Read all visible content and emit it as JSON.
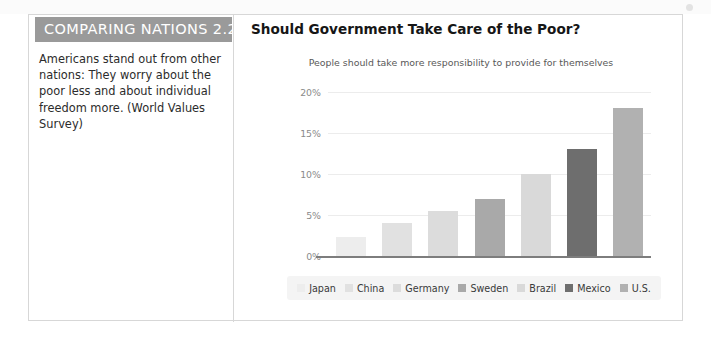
{
  "box": {
    "header_label": "COMPARING NATIONS 2.2",
    "body_text": "Americans stand out from other nations: They worry about the poor less and about individual freedom more. (World Values Survey)"
  },
  "chart_data": {
    "type": "bar",
    "title": "Should Government Take Care of the Poor?",
    "subtitle": "People should take more responsibility to provide for themselves",
    "xlabel": "",
    "ylabel": "",
    "ylim": [
      0,
      20
    ],
    "ytick_labels": [
      "0%",
      "5%",
      "10%",
      "15%",
      "20%"
    ],
    "ytick_values": [
      0,
      5,
      10,
      15,
      20
    ],
    "grid": true,
    "legend_position": "bottom",
    "categories": [
      "Japan",
      "China",
      "Germany",
      "Sweden",
      "Brazil",
      "Mexico",
      "U.S."
    ],
    "values": [
      2.3,
      4.0,
      5.5,
      7.0,
      10.0,
      13.0,
      18.0
    ],
    "colors": [
      "#ededed",
      "#e1e1e1",
      "#dcdcdc",
      "#a9a9a9",
      "#d9d9d9",
      "#6e6e6e",
      "#b1b1b1"
    ]
  },
  "palette": {
    "header_band": "#9a9a9a",
    "border": "#d7d7d7",
    "axis": "#7d7d7d",
    "gridline": "#ececec",
    "legend_bg": "#f4f4f4",
    "title_text": "#161616",
    "subtitle_text": "#585858",
    "tick_text": "#8a8a8a"
  }
}
